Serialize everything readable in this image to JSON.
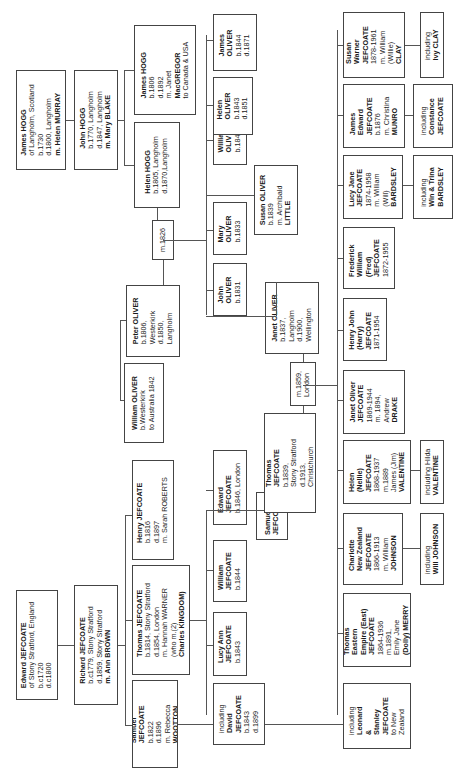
{
  "diagram": {
    "orientation": "rotated 90 degrees counter-clockwise",
    "people": {
      "edward_jefcoate": [
        "Edward JEFCOATE",
        "of Stony Stratford, England",
        "b.c1720",
        "d.c1800"
      ],
      "richard_jefcoate": [
        "Richard JEFCOATE",
        "b.c1779, Stony Stratford",
        "d.1859, Stony Stratford",
        "m. Ann BROWN"
      ],
      "samuel_jefcoate_1822": [
        "Samuel",
        "JEFCOATE",
        "b.1822",
        "d.1896",
        "m. Rebecca",
        "WOOTTON"
      ],
      "thomas_jefcoate_1814": [
        "Thomas JEFCOATE",
        "b.1814, Stony Stratford",
        "d.1854, London",
        "m. Hannah WARNER",
        "(who m.(2)",
        "Charles KINGDOM)"
      ],
      "henry_jefcoate_1816": [
        "Henry JEFCOATE",
        "b.1816",
        "d.1897",
        "m. Sarah ROBERTS"
      ],
      "including_david": [
        "including",
        "David",
        "JEFCOATE",
        "b.1843",
        "d.1899"
      ],
      "lucy_ann": [
        "Lucy Ann",
        "JEFCOATE",
        "b.1843"
      ],
      "william_jefcoate_1844": [
        "William",
        "JEFCOATE",
        "b.1844"
      ],
      "samuel_jefcoate_child": [
        "Samuel",
        "JEFCOATE"
      ],
      "edward_jefcoate_1846": [
        "Edward",
        "JEFCOATE",
        "b.1846, London"
      ],
      "thomas_jefcoate_1839": [
        "Thomas",
        "JEFCOATE",
        "b.1839,",
        "Stony Stratford",
        "d.1913,",
        "Christchurch"
      ],
      "marriage_1859": [
        "m.1859,",
        "London"
      ],
      "janet_oliver": [
        "Janet OLIVER",
        "b.1837,",
        "Langholm",
        "d.1900,",
        "Wellington"
      ],
      "james_hogg_1730": [
        "James HOGG",
        "of Langholm, Scotland",
        "b.1730",
        "d.1800, Langholm",
        "m. Helen MURRAY"
      ],
      "john_hogg": [
        "John HOGG",
        "b.1770, Langholm",
        "d.1847, Langholm",
        "m. Mary BLAKE"
      ],
      "james_hogg_1806": [
        "James HOGG",
        "b.1806",
        "d.1892",
        "m. Janet",
        "MacGREGOR",
        "to Canada & USA"
      ],
      "helen_hogg": [
        "Helen HOGG",
        "b.1805, Langholm",
        "d.1870,Langholm"
      ],
      "marriage_1826": [
        "m.1826"
      ],
      "peter_oliver": [
        "Peter OLIVER",
        "b.1806,",
        "Westerkirk",
        "d.1850,",
        "Langholm"
      ],
      "william_oliver_westerkirk": [
        "William OLIVER",
        "b.Westerkirk",
        "to Australia 1842"
      ],
      "john_oliver": [
        "John",
        "OLIVER",
        "b.1831"
      ],
      "mary_oliver": [
        "Mary",
        "OLIVER",
        "b.1833"
      ],
      "susan_oliver": [
        "Susan OLIVER",
        "b.1839",
        "m. Archibald",
        "LITTLE"
      ],
      "william_oliver_1840": [
        "William",
        "OLIVER",
        "b.1840"
      ],
      "helen_oliver": [
        "Helen",
        "OLIVER",
        "b.1843",
        "d.1851"
      ],
      "james_oliver": [
        "James",
        "OLIVER",
        "b.1844",
        "d.1871"
      ],
      "thomas_eastern_empire": [
        "Thomas",
        "Eastern",
        "Empire (East)",
        "JEFCOATE",
        "1864-1936",
        "m.1891,",
        "Emily Jane",
        "(Dolly) MERRY"
      ],
      "including_leonard_stanley": [
        "including",
        "Leonard",
        "&",
        "Stanley",
        "JEFCOATE",
        "to New",
        "Zealand"
      ],
      "charlotte": [
        "Charlotte",
        "New Zealand",
        "JEFCOATE",
        "1866-1913",
        "m. William",
        "JOHNSON"
      ],
      "including_will_johnson": [
        "including",
        "Will JOHNSON"
      ],
      "helen_nellie": [
        "Helen",
        "(Nellie)",
        "JEFCOATE",
        "1868-1937",
        "m.1889",
        "James (Jim)",
        "VALENTINE"
      ],
      "including_hilda": [
        "including Hilda",
        "VALENTINE"
      ],
      "janet_oliver_jefcoate": [
        "Janet Oliver",
        "JEFCOATE",
        "1869-1944",
        "m. 1894,",
        "Andrew",
        "DRAKE"
      ],
      "henry_john": [
        "Henry John",
        "(Harry)",
        "JEFCOATE",
        "1871-1954"
      ],
      "frederick_william": [
        "Frederick",
        "William",
        "(Fred)",
        "JEFCOATE",
        "1872-1955"
      ],
      "lucy_jane": [
        "Lucy Jane",
        "JEFCOATE",
        "1874-1958",
        "m. William",
        "(Will)",
        "BARDSLEY"
      ],
      "including_win_trina": [
        "including",
        "Win & Trina",
        "BARDSLEY"
      ],
      "james_edward": [
        "James",
        "Edward",
        "JEFCOATE",
        "b.1876",
        "m. Christina",
        "MUNRO"
      ],
      "including_constance": [
        "including",
        "Constance",
        "JEFCOATE"
      ],
      "susan_warner": [
        "Susan",
        "Warner",
        "JEFCOATE",
        "1878-1961",
        "m. William",
        "(Willie)",
        "CLAY"
      ],
      "including_ivy": [
        "including",
        "Ivy CLAY"
      ]
    }
  }
}
